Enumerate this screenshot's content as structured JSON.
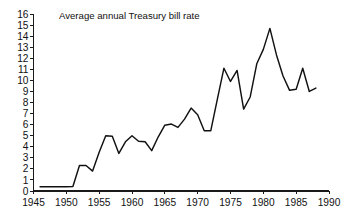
{
  "chart_data": {
    "type": "line",
    "title": "Average annual Treasury bill rate",
    "xlabel": "",
    "ylabel": "",
    "xlim": [
      1945,
      1990
    ],
    "ylim": [
      0,
      16
    ],
    "grid": false,
    "legend": "none",
    "x_tick_labels": [
      "1945",
      "1950",
      "1955",
      "1960",
      "1965",
      "1970",
      "1975",
      "1980",
      "1985",
      "1990"
    ],
    "x_ticks": [
      1945,
      1950,
      1955,
      1960,
      1965,
      1970,
      1975,
      1980,
      1985,
      1990
    ],
    "y_tick_labels": [
      "0",
      "1",
      "2",
      "3",
      "4",
      "5",
      "6",
      "7",
      "8",
      "9",
      "10",
      "11",
      "12",
      "13",
      "14",
      "15",
      "16"
    ],
    "y_ticks": [
      0,
      1,
      2,
      3,
      4,
      5,
      6,
      7,
      8,
      9,
      10,
      11,
      12,
      13,
      14,
      15,
      16
    ],
    "series": [
      {
        "name": "Average annual Treasury bill rate",
        "color": "#111111",
        "x": [
          1946,
          1947,
          1948,
          1949,
          1950,
          1951,
          1952,
          1953,
          1954,
          1955,
          1956,
          1957,
          1958,
          1959,
          1960,
          1961,
          1962,
          1963,
          1964,
          1965,
          1966,
          1967,
          1968,
          1969,
          1970,
          1971,
          1972,
          1973,
          1974,
          1975,
          1976,
          1977,
          1978,
          1979,
          1980,
          1981,
          1982,
          1983,
          1984,
          1985,
          1986,
          1987,
          1988
        ],
        "values": [
          0.38,
          0.38,
          0.38,
          0.38,
          0.38,
          0.4,
          2.3,
          2.3,
          1.8,
          3.5,
          5.0,
          4.95,
          3.4,
          4.45,
          5.0,
          4.5,
          4.45,
          3.65,
          4.9,
          5.95,
          6.05,
          5.75,
          6.5,
          7.5,
          6.9,
          5.45,
          5.45,
          8.3,
          11.1,
          9.9,
          10.9,
          7.4,
          8.5,
          11.5,
          12.8,
          14.7,
          12.3,
          10.4,
          9.1,
          9.2,
          11.1,
          9.0,
          9.3
        ]
      }
    ]
  }
}
